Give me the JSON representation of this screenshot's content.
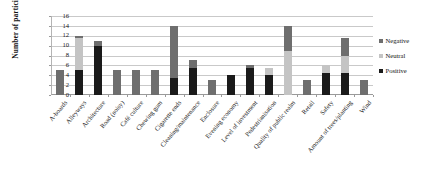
{
  "chart_data": {
    "type": "bar",
    "title": "",
    "subtitle": "",
    "xlabel": "",
    "ylabel": "Number of participants",
    "ylim": [
      0,
      16
    ],
    "yticks": [
      0,
      2,
      4,
      6,
      8,
      10,
      12,
      14,
      16
    ],
    "grid": true,
    "stacked": true,
    "legend_position": "right",
    "categories": [
      "A-boards",
      "Alleyways",
      "Architecture",
      "Road (noisy)",
      "Café culture",
      "Chewing gum",
      "Cigarette ends",
      "Cleaning/maintenance",
      "Enclosure",
      "Evening economy",
      "Level of investment",
      "Pedestrianisation",
      "Quality of public realm",
      "Retail",
      "Safety",
      "Amount of trees/planting",
      "Wind"
    ],
    "series": [
      {
        "name": "Positive",
        "color": "#1a1a1a",
        "values": [
          0,
          5,
          10,
          0,
          0,
          0,
          3.5,
          5.5,
          0,
          4,
          5.5,
          4,
          0,
          0,
          4.5,
          4.5,
          0
        ]
      },
      {
        "name": "Neutral",
        "color": "#c4c4c4",
        "values": [
          0,
          6.5,
          0,
          0,
          0,
          0,
          0,
          0,
          0,
          0,
          0,
          1.5,
          9,
          0,
          1.5,
          3.5,
          0
        ]
      },
      {
        "name": "Negative",
        "color": "#6e6e6e",
        "values": [
          5,
          0.5,
          1,
          5,
          5,
          5,
          10.5,
          1.5,
          3,
          0,
          0.5,
          0,
          5,
          3,
          0,
          3.5,
          3
        ]
      }
    ]
  },
  "legend": {
    "items": [
      {
        "label": "Negative",
        "color": "#6e6e6e"
      },
      {
        "label": "Neutral",
        "color": "#c4c4c4"
      },
      {
        "label": "Positive",
        "color": "#1a1a1a"
      }
    ]
  },
  "axis": {
    "y_title": "Number of participants"
  }
}
